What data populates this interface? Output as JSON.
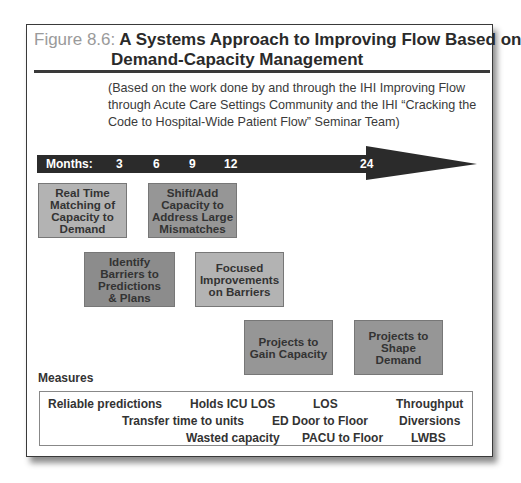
{
  "figure": {
    "label": "Figure 8.6:",
    "title_line1": "A Systems Approach to Improving Flow Based on",
    "title_line2": "Demand-Capacity Management",
    "subtitle": "(Based on the work done by and through the IHI Improving Flow through Acute Care Settings Community and the IHI “Cracking the Code to Hospital-Wide Patient Flow” Seminar Team)"
  },
  "timeline": {
    "label": "Months:",
    "ticks": [
      "3",
      "6",
      "9",
      "12",
      "24"
    ],
    "arrow_color": "#2b2b2b"
  },
  "boxes": [
    {
      "id": "real-time-matching",
      "text": "Real Time Matching of Capacity to Demand",
      "lines": [
        "Real Time",
        "Matching of",
        "Capacity to",
        "Demand"
      ],
      "fill": "#b3b3b3"
    },
    {
      "id": "shift-add-capacity",
      "text": "Shift/Add Capacity to Address Large Mismatches",
      "lines": [
        "Shift/Add",
        "Capacity to",
        "Address Large",
        "Mismatches"
      ],
      "fill": "#969696"
    },
    {
      "id": "identify-barriers",
      "text": "Identify Barriers to Predictions & Plans",
      "lines": [
        "Identify",
        "Barriers to",
        "Predictions",
        "& Plans"
      ],
      "fill": "#8c8c8c"
    },
    {
      "id": "focused-improvements",
      "text": "Focused Improvements on Barriers",
      "lines": [
        "Focused",
        "Improvements",
        "on Barriers"
      ],
      "fill": "#b3b3b3"
    },
    {
      "id": "gain-capacity",
      "text": "Projects to Gain Capacity",
      "lines": [
        "Projects to",
        "Gain Capacity"
      ],
      "fill": "#969696"
    },
    {
      "id": "shape-demand",
      "text": "Projects to Shape Demand",
      "lines": [
        "Projects to",
        "Shape",
        "Demand"
      ],
      "fill": "#969696"
    }
  ],
  "measures": {
    "label": "Measures",
    "items": [
      "Reliable predictions",
      "Holds ICU LOS",
      "LOS",
      "Throughput",
      "Transfer time to units",
      "ED Door to Floor",
      "Diversions",
      "Wasted capacity",
      "PACU to Floor",
      "LWBS"
    ]
  }
}
